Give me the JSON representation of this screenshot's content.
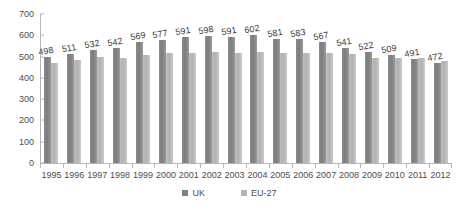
{
  "chart_data": {
    "type": "bar",
    "title": "",
    "xlabel": "",
    "ylabel": "",
    "ylim": [
      0,
      700
    ],
    "ytick_step": 100,
    "yticks": [
      700,
      600,
      500,
      400,
      300,
      200,
      100,
      0
    ],
    "grid": false,
    "legend_position": "bottom",
    "categories": [
      "1995",
      "1996",
      "1997",
      "1998",
      "1999",
      "2000",
      "2001",
      "2002",
      "2003",
      "2004",
      "2005",
      "2006",
      "2007",
      "2008",
      "2009",
      "2010",
      "2011",
      "2012"
    ],
    "series": [
      {
        "name": "UK",
        "color": "#808080",
        "values": [
          498,
          511,
          532,
          542,
          569,
          577,
          591,
          598,
          591,
          602,
          581,
          583,
          567,
          541,
          522,
          509,
          491,
          472
        ],
        "data_labels": [
          "498",
          "511",
          "532",
          "542",
          "569",
          "577",
          "591",
          "598",
          "591",
          "602",
          "581",
          "583",
          "567",
          "541",
          "522",
          "509",
          "491",
          "472"
        ]
      },
      {
        "name": "EU-27",
        "color": "#b3b3b3",
        "values": [
          470,
          482,
          497,
          494,
          509,
          518,
          516,
          523,
          519,
          522,
          518,
          519,
          516,
          512,
          495,
          492,
          494,
          480
        ],
        "data_labels": []
      }
    ]
  },
  "legend": {
    "items": [
      {
        "label": "UK",
        "swatch": "uk-swatch"
      },
      {
        "label": "EU-27",
        "swatch": "eu27-swatch"
      }
    ]
  }
}
